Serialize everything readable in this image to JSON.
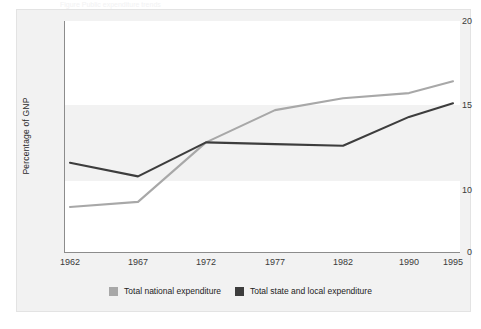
{
  "figure": {
    "top_caption": "Figure   Public expenditure trends",
    "axis_title_y": "Percentage of GNP"
  },
  "colors": {
    "series_national": "#a8a8a8",
    "series_state_local": "#3d3d3d",
    "band": "#f2f2f2",
    "plot_bg": "#ffffff",
    "panel_bg": "#f2f2f2",
    "axis": "#8c8c8c",
    "text": "#2b2b2b"
  },
  "legend": {
    "position": "bottom",
    "items": [
      {
        "label": "Total national expenditure",
        "color": "#a8a8a8"
      },
      {
        "label": "Total state and local expenditure",
        "color": "#3d3d3d"
      }
    ]
  },
  "chart_data": {
    "type": "line",
    "title": "",
    "subtitle": "",
    "xlabel": "",
    "ylabel": "Percentage of GNP",
    "categories": [
      "1962",
      "1967",
      "1972",
      "1977",
      "1982",
      "1990",
      "1995"
    ],
    "x_tick_labels": [
      "1962",
      "1967",
      "1972",
      "1977",
      "1982",
      "1990",
      "1995"
    ],
    "y_tick_labels": [
      "0",
      "10",
      "15",
      "20"
    ],
    "y_tick_values": [
      0,
      10,
      15,
      20
    ],
    "ylim": [
      0,
      20
    ],
    "axis_break": true,
    "grid": false,
    "banded_background": true,
    "series": [
      {
        "name": "Total national expenditure",
        "color": "#a8a8a8",
        "values": [
          9.0,
          9.3,
          12.8,
          14.7,
          15.4,
          15.7,
          16.4
        ]
      },
      {
        "name": "Total state and local expenditure",
        "color": "#3d3d3d",
        "values": [
          11.6,
          10.8,
          12.8,
          12.7,
          12.6,
          14.3,
          15.1
        ]
      }
    ]
  }
}
